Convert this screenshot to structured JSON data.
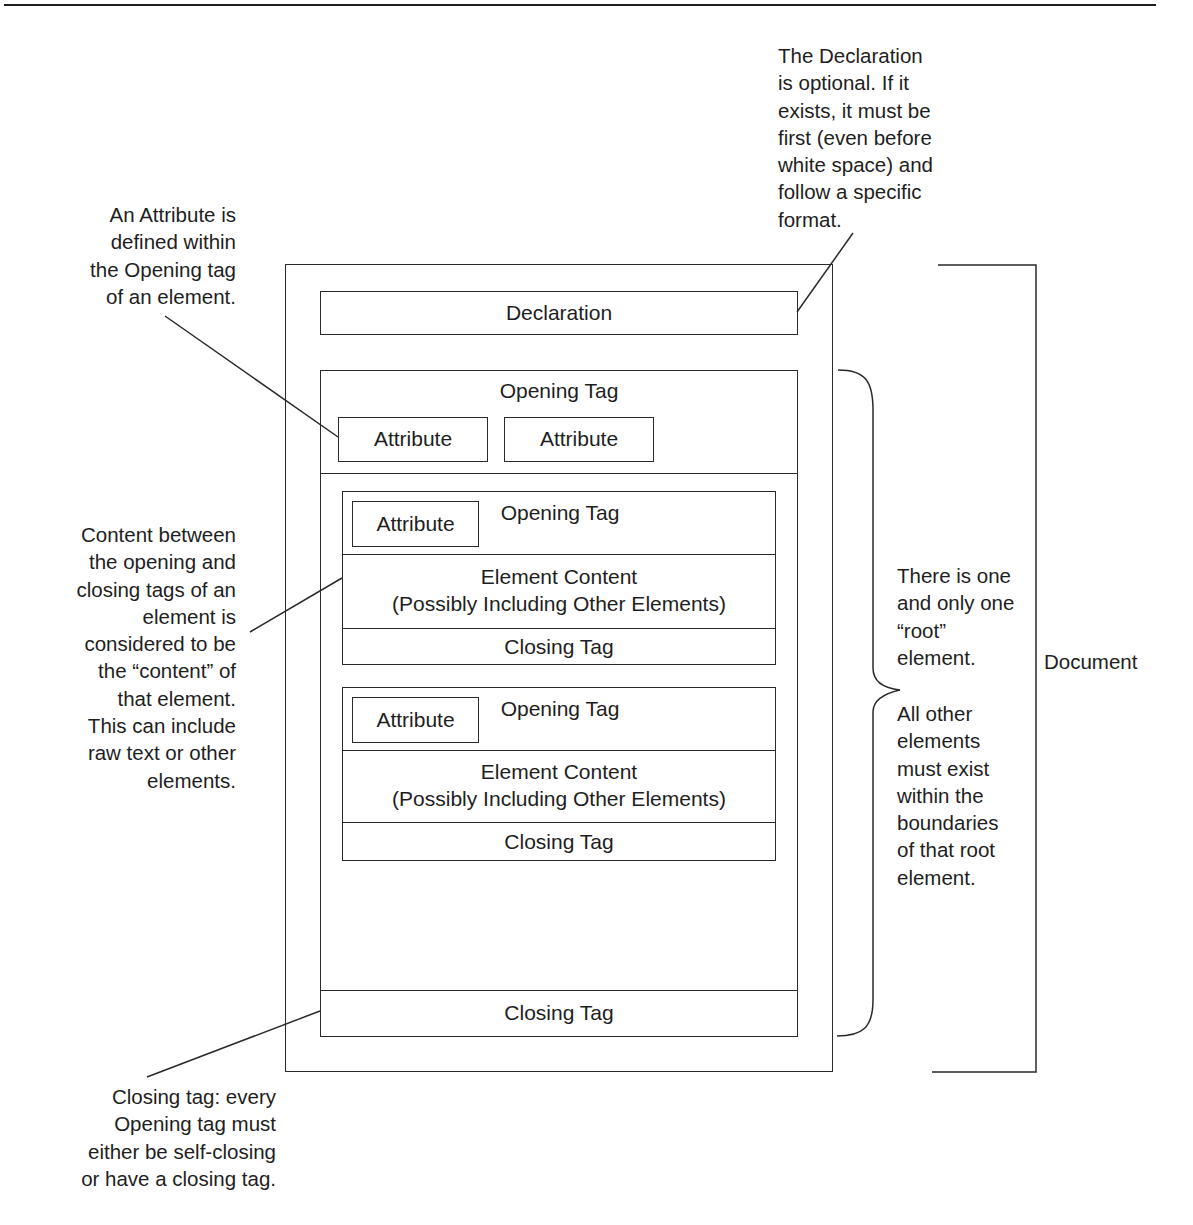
{
  "diagram": {
    "document_label": "Document",
    "declaration": {
      "label": "Declaration"
    },
    "root_element": {
      "opening_tag": {
        "label": "Opening Tag",
        "attributes": [
          "Attribute",
          "Attribute"
        ]
      },
      "children": [
        {
          "opening_tag": {
            "label": "Opening Tag",
            "attribute": "Attribute"
          },
          "content": {
            "line1": "Element Content",
            "line2": "(Possibly Including Other Elements)"
          },
          "closing_tag": "Closing Tag"
        },
        {
          "opening_tag": {
            "label": "Opening Tag",
            "attribute": "Attribute"
          },
          "content": {
            "line1": "Element Content",
            "line2": "(Possibly Including Other Elements)"
          },
          "closing_tag": "Closing Tag"
        }
      ],
      "closing_tag": "Closing Tag"
    }
  },
  "annotations": {
    "declaration_note": "The Declaration\nis optional. If it\nexists, it must be\nfirst (even before\nwhite space) and\nfollow a specific\nformat.",
    "attribute_note": "An Attribute is\ndefined within\nthe Opening tag\nof an element.",
    "content_note": "Content between\nthe opening and\nclosing tags of an\nelement is\nconsidered to be\nthe “content” of\nthat element.\nThis can include\nraw text or other\nelements.",
    "root_note_1": "There is one\nand only one\n“root”\nelement.",
    "root_note_2": "All other\nelements\nmust exist\nwithin the\nboundaries\nof that root\nelement.",
    "closing_note": "Closing tag: every\nOpening tag must\neither be self-closing\nor have a closing tag."
  }
}
